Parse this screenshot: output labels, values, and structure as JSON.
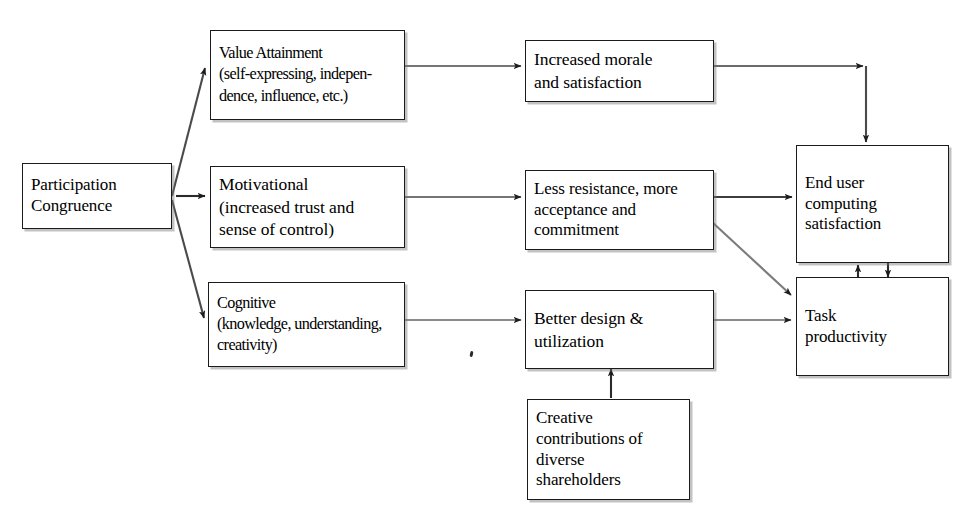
{
  "diagram": {
    "type": "flowchart",
    "colors": {
      "background": "#ffffff",
      "box_border": "#1b1b1b",
      "box_fill": "#ffffff",
      "edge": "#3a3a3a",
      "shadow": "#787878",
      "text": "#000000"
    },
    "nodes": {
      "participation_congruence": {
        "lines": [
          "Participation",
          "Congruence"
        ],
        "line_0": "Participation",
        "line_1": "Congruence"
      },
      "value_attainment": {
        "lines": [
          "Value Attainment",
          "(self-expressing, indepen-",
          "dence, influence, etc.)"
        ],
        "line_0": "Value Attainment",
        "line_1": "(self-expressing, indepen-",
        "line_2": "dence, influence, etc.)"
      },
      "motivational": {
        "lines": [
          "Motivational",
          "(increased trust and",
          "sense of control)"
        ],
        "line_0": "Motivational",
        "line_1": "(increased trust and",
        "line_2": "sense of control)"
      },
      "cognitive": {
        "lines": [
          "Cognitive",
          "(knowledge, understanding,",
          "creativity)"
        ],
        "line_0": "Cognitive",
        "line_1": "(knowledge, understanding,",
        "line_2": "creativity)"
      },
      "increased_morale": {
        "lines": [
          "Increased morale",
          "and satisfaction"
        ],
        "line_0": "Increased morale",
        "line_1": "and satisfaction"
      },
      "less_resistance": {
        "lines": [
          "Less resistance, more",
          "acceptance and",
          "commitment"
        ],
        "line_0": "Less resistance, more",
        "line_1": "acceptance and",
        "line_2": "commitment"
      },
      "better_design": {
        "lines": [
          "Better design &",
          "utilization"
        ],
        "line_0": "Better design &",
        "line_1": "utilization"
      },
      "creative_contributions": {
        "lines": [
          "Creative",
          "contributions of",
          "diverse",
          "shareholders"
        ],
        "line_0": "Creative",
        "line_1": "contributions of",
        "line_2": "diverse",
        "line_3": "shareholders"
      },
      "end_user_satisfaction": {
        "lines": [
          "End user",
          "computing",
          "satisfaction"
        ],
        "line_0": "End user",
        "line_1": "computing",
        "line_2": "satisfaction"
      },
      "task_productivity": {
        "lines": [
          "Task",
          "productivity"
        ],
        "line_0": "Task",
        "line_1": "productivity"
      }
    },
    "edges": [
      {
        "from": "participation_congruence",
        "to": "value_attainment",
        "style": "diagonal-up",
        "arrow": true
      },
      {
        "from": "participation_congruence",
        "to": "motivational",
        "style": "straight",
        "arrow": true
      },
      {
        "from": "participation_congruence",
        "to": "cognitive",
        "style": "diagonal-down",
        "arrow": true
      },
      {
        "from": "value_attainment",
        "to": "increased_morale",
        "style": "straight",
        "arrow": true
      },
      {
        "from": "motivational",
        "to": "less_resistance",
        "style": "straight",
        "arrow": true
      },
      {
        "from": "cognitive",
        "to": "better_design",
        "style": "straight",
        "arrow": true
      },
      {
        "from": "increased_morale",
        "to": "end_user_satisfaction",
        "style": "elbow-right-down",
        "arrow": true
      },
      {
        "from": "less_resistance",
        "to": "end_user_satisfaction",
        "style": "straight",
        "arrow": true
      },
      {
        "from": "less_resistance",
        "to": "task_productivity",
        "style": "diagonal-down",
        "arrow": true
      },
      {
        "from": "better_design",
        "to": "task_productivity",
        "style": "straight",
        "arrow": true
      },
      {
        "from": "creative_contributions",
        "to": "better_design",
        "style": "straight-up",
        "arrow": true
      },
      {
        "from": "task_productivity",
        "to": "end_user_satisfaction",
        "style": "vertical-up",
        "arrow": true
      },
      {
        "from": "end_user_satisfaction",
        "to": "task_productivity",
        "style": "vertical-down",
        "arrow": true
      }
    ]
  }
}
